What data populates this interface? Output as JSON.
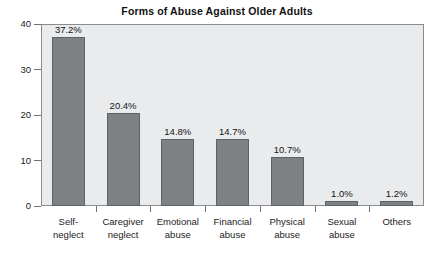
{
  "chart_data": {
    "type": "bar",
    "title": "Forms of Abuse Against Older Adults",
    "xlabel": "",
    "ylabel": "",
    "ylim": [
      0,
      40
    ],
    "yticks": [
      0,
      10,
      20,
      30,
      40
    ],
    "ytick_labels": [
      "0",
      "10",
      "20",
      "30",
      "40"
    ],
    "grid": false,
    "legend": "none",
    "categories": [
      "Self-\nneglect",
      "Caregiver\nneglect",
      "Emotional\nabuse",
      "Financial\nabuse",
      "Physical\nabuse",
      "Sexual\nabuse",
      "Others"
    ],
    "category_lines": [
      [
        "Self-",
        "neglect"
      ],
      [
        "Caregiver",
        "neglect"
      ],
      [
        "Emotional",
        "abuse"
      ],
      [
        "Financial",
        "abuse"
      ],
      [
        "Physical",
        "abuse"
      ],
      [
        "Sexual",
        "abuse"
      ],
      [
        "Others"
      ]
    ],
    "values": [
      37.2,
      20.4,
      14.8,
      14.7,
      10.7,
      1.0,
      1.2
    ],
    "value_labels": [
      "37.2%",
      "20.4%",
      "14.8%",
      "14.7%",
      "10.7%",
      "1.0%",
      "1.2%"
    ],
    "colors": {
      "bar_fill": "#7d8184",
      "bar_stroke": "#5e6265",
      "plot_background": "#e9ebed",
      "axis_line": "#8a8d90",
      "text": "#1c1c1c",
      "page_background": "#ffffff"
    }
  }
}
